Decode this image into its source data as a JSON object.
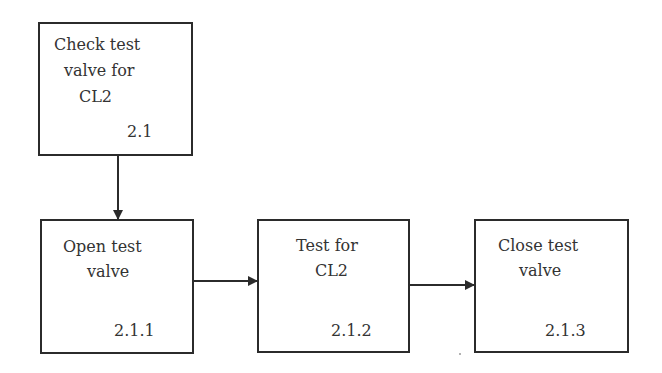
{
  "diagram": {
    "type": "task-decomposition-flowchart",
    "nodes": [
      {
        "id": "2.1",
        "lines": [
          "Check test",
          "valve for",
          "CL2"
        ],
        "number": "2.1"
      },
      {
        "id": "2.1.1",
        "lines": [
          "Open test",
          "valve"
        ],
        "number": "2.1.1"
      },
      {
        "id": "2.1.2",
        "lines": [
          "Test for",
          "CL2"
        ],
        "number": "2.1.2"
      },
      {
        "id": "2.1.3",
        "lines": [
          "Close test",
          "valve"
        ],
        "number": "2.1.3"
      }
    ],
    "edges": [
      {
        "from": "2.1",
        "to": "2.1.1",
        "direction": "down"
      },
      {
        "from": "2.1.1",
        "to": "2.1.2",
        "direction": "right"
      },
      {
        "from": "2.1.2",
        "to": "2.1.3",
        "direction": "right"
      }
    ],
    "colors": {
      "stroke": "#2b2b2b",
      "text": "#333333",
      "background": "#ffffff"
    }
  }
}
